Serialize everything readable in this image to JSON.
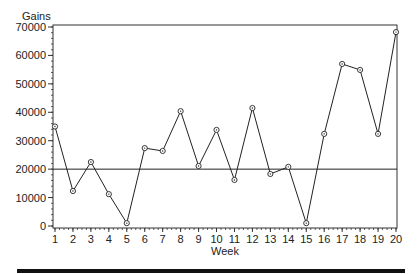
{
  "chart_data": {
    "type": "line",
    "title": "",
    "xlabel": "Week",
    "ylabel": "Gains",
    "x": [
      1,
      2,
      3,
      4,
      5,
      6,
      7,
      8,
      9,
      10,
      11,
      12,
      13,
      14,
      15,
      16,
      17,
      18,
      19,
      20
    ],
    "series": [
      {
        "name": "Gains",
        "values": [
          35000,
          12300,
          22500,
          11200,
          1000,
          27400,
          26400,
          40400,
          21100,
          33800,
          16200,
          41500,
          18300,
          20800,
          1000,
          32400,
          57000,
          54900,
          32400,
          68200
        ],
        "marker": "circle",
        "color": "#222222"
      }
    ],
    "reference_line": {
      "y": 20000,
      "color": "#222222"
    },
    "xlim": [
      1,
      20
    ],
    "ylim": [
      0,
      70000
    ],
    "y_ticks": [
      0,
      10000,
      20000,
      30000,
      40000,
      50000,
      60000,
      70000
    ],
    "y_tick_labels": [
      "0",
      "10000",
      "20000",
      "30000",
      "40000",
      "50000",
      "60000",
      "70000"
    ],
    "x_tick_labels": [
      "1",
      "2",
      "3",
      "4",
      "5",
      "6",
      "7",
      "8",
      "9",
      "10",
      "11",
      "12",
      "13",
      "14",
      "15",
      "16",
      "17",
      "18",
      "19",
      "20"
    ],
    "grid": false,
    "legend": null
  },
  "labels": {
    "y_axis_title": "Gains",
    "x_axis_title": "Week"
  }
}
